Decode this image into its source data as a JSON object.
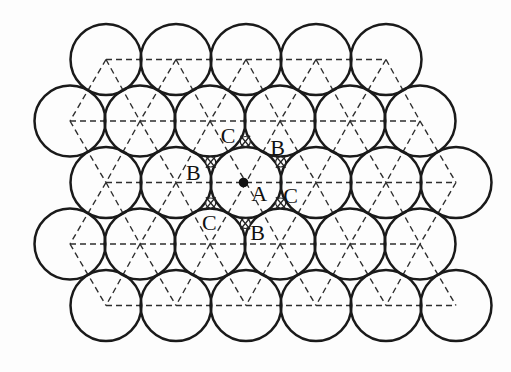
{
  "figure": {
    "type": "close-packed-spheres-diagram",
    "canvas": {
      "width": 511,
      "height": 372,
      "background": "#fdfdfd"
    },
    "packing": {
      "circle_radius": 35.5,
      "circle_stroke_width": 2.5,
      "circle_stroke_color": "#1a1a1a",
      "circle_fill_color": "#fdfdfd",
      "rows": [
        {
          "y": 59.5,
          "xs": [
            106,
            176,
            246,
            316,
            386
          ]
        },
        {
          "y": 121.0,
          "xs": [
            70,
            140,
            210,
            280,
            350,
            420
          ]
        },
        {
          "y": 182.5,
          "xs": [
            106,
            176,
            246,
            316,
            386,
            456
          ]
        },
        {
          "y": 244.0,
          "xs": [
            70,
            140,
            210,
            280,
            350,
            420
          ]
        },
        {
          "y": 305.5,
          "xs": [
            106,
            176,
            246,
            316,
            386,
            456
          ]
        }
      ],
      "neighbor_max_distance": 75
    },
    "lattice_lines": {
      "color": "#2e2e2e",
      "width": 1.4,
      "dash": "6 4"
    },
    "central_atom_dot": {
      "x": 243.5,
      "y": 182.5,
      "r": 4.8,
      "color": "#111111"
    },
    "hole_markers": {
      "radius": 5,
      "stroke_width": 1.2,
      "stroke_color": "#222222",
      "cross_length": 15,
      "sites": [
        {
          "x": 245.3,
          "y": 141.5
        },
        {
          "x": 210.7,
          "y": 162.0
        },
        {
          "x": 280.7,
          "y": 162.0
        },
        {
          "x": 210.7,
          "y": 203.0
        },
        {
          "x": 280.7,
          "y": 203.0
        },
        {
          "x": 245.3,
          "y": 223.5
        }
      ]
    },
    "site_labels": {
      "font_size": 22,
      "color": "#111111",
      "items": [
        {
          "text": "C",
          "x": 228.0,
          "y": 135.5
        },
        {
          "text": "B",
          "x": 277.5,
          "y": 147.0
        },
        {
          "text": "B",
          "x": 193.3,
          "y": 172.7
        },
        {
          "text": "A",
          "x": 259.3,
          "y": 193.5
        },
        {
          "text": "C",
          "x": 290.5,
          "y": 195.0
        },
        {
          "text": "C",
          "x": 209.3,
          "y": 222.0
        },
        {
          "text": "B",
          "x": 257.7,
          "y": 232.5
        }
      ]
    }
  }
}
